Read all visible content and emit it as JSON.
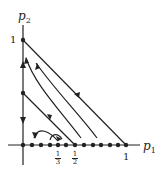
{
  "figure": {
    "x_axis_label": "p",
    "x_axis_sub": "1",
    "y_axis_label": "p",
    "y_axis_sub": "2",
    "x_ticks": [
      {
        "num": "1",
        "den": "3"
      },
      {
        "num": "1",
        "den": "2"
      }
    ],
    "x_tick_one": "1",
    "y_tick_one": "1",
    "line_color": "#222222"
  }
}
